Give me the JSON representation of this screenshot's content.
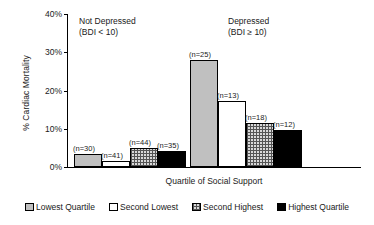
{
  "chart_data": {
    "type": "bar",
    "title": "",
    "xlabel": "Quartile of Social Support",
    "ylabel": "% Cardiac Mortality",
    "ylim": [
      0,
      40
    ],
    "ytick_labels": [
      "40%",
      "30%",
      "20%",
      "10%",
      "0%"
    ],
    "ytick_values": [
      40,
      30,
      20,
      10,
      0
    ],
    "grid": false,
    "legend_position": "bottom",
    "categories": [
      "Not Depressed\n(BDI < 10)",
      "Depressed\n(BDI ≥ 10)"
    ],
    "group_headers": [
      {
        "line1": "Not Depressed",
        "line2": "(BDI < 10)"
      },
      {
        "line1": "Depressed",
        "line2": "(BDI ≥ 10)"
      }
    ],
    "series": [
      {
        "name": "Lowest Quartile",
        "fill": "fill-lowest",
        "color": "#c0c0c0",
        "values": [
          3.5,
          28.0
        ],
        "point_labels": [
          "(n=30)",
          "(n=25)"
        ]
      },
      {
        "name": "Second Lowest",
        "fill": "fill-second-lowest",
        "color": "#ffffff",
        "values": [
          1.6,
          17.2
        ],
        "point_labels": [
          "(n=41)",
          "(n=13)"
        ]
      },
      {
        "name": "Second Highest",
        "fill": "fill-second-highest",
        "color": "#d9d9d9",
        "values": [
          5.0,
          11.5
        ],
        "point_labels": [
          "(n=44)",
          "(n=18)"
        ]
      },
      {
        "name": "Highest Quartile",
        "fill": "fill-highest",
        "color": "#000000",
        "values": [
          4.1,
          9.6
        ],
        "point_labels": [
          "(n=35)",
          "(n=12)"
        ]
      }
    ]
  },
  "legend": {
    "items": [
      {
        "label": "Lowest Quartile"
      },
      {
        "label": "Second Lowest"
      },
      {
        "label": "Second Highest"
      },
      {
        "label": "Highest Quartile"
      }
    ]
  }
}
